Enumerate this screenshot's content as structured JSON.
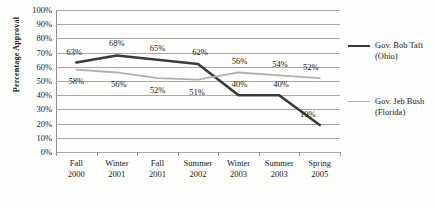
{
  "chart_data": {
    "type": "line",
    "title": "",
    "xlabel": "",
    "ylabel": "Percentage Approval",
    "ylim": [
      0,
      100
    ],
    "ytick_step": 10,
    "grid": true,
    "legend_position": "right",
    "categories": [
      {
        "line1": "Fall",
        "line2": "2000"
      },
      {
        "line1": "Winter",
        "line2": "2001"
      },
      {
        "line1": "Fall",
        "line2": "2001"
      },
      {
        "line1": "Summer",
        "line2": "2002"
      },
      {
        "line1": "Winter",
        "line2": "2003"
      },
      {
        "line1": "Summer",
        "line2": "2003"
      },
      {
        "line1": "Spring",
        "line2": "2005"
      }
    ],
    "ytick_labels": [
      "100%",
      "90%",
      "80%",
      "70%",
      "60%",
      "50%",
      "40%",
      "30%",
      "20%",
      "10%",
      "0%"
    ],
    "ytick_values": [
      100,
      90,
      80,
      70,
      60,
      50,
      40,
      30,
      20,
      10,
      0
    ],
    "series": [
      {
        "name": "Gov. Bob Taft",
        "sublabel": "(Ohio)",
        "legend_line1": "Gov. Bob Taft",
        "legend_line2": "(Ohio)",
        "color": "#3a3a3a",
        "width": 2.6,
        "values": [
          63,
          68,
          65,
          62,
          40,
          40,
          19
        ],
        "labels": [
          "63%",
          "68%",
          "65%",
          "62%",
          "40%",
          "40%",
          "19%"
        ],
        "label_offsets": [
          {
            "dx": -2,
            "dy": -11
          },
          {
            "dx": 0,
            "dy": -12
          },
          {
            "dx": 0,
            "dy": -12
          },
          {
            "dx": 2,
            "dy": -12
          },
          {
            "dx": 1,
            "dy": -11
          },
          {
            "dx": 2,
            "dy": -11
          },
          {
            "dx": -12,
            "dy": -11
          }
        ]
      },
      {
        "name": "Gov. Jeb Bush",
        "sublabel": "(Florida)",
        "legend_line1": "Gov. Jeb Bush",
        "legend_line2": "(Florida)",
        "color": "#b0b0b0",
        "width": 1.8,
        "values": [
          58,
          56,
          52,
          51,
          56,
          54,
          52
        ],
        "labels": [
          "58%",
          "56%",
          "52%",
          "51%",
          "56%",
          "54%",
          "52%"
        ],
        "label_offsets": [
          {
            "dx": 0,
            "dy": 11
          },
          {
            "dx": 2,
            "dy": 12
          },
          {
            "dx": 0,
            "dy": 12
          },
          {
            "dx": -1,
            "dy": 12
          },
          {
            "dx": 1,
            "dy": -11
          },
          {
            "dx": 1,
            "dy": -11
          },
          {
            "dx": -9,
            "dy": -11
          }
        ]
      }
    ]
  }
}
